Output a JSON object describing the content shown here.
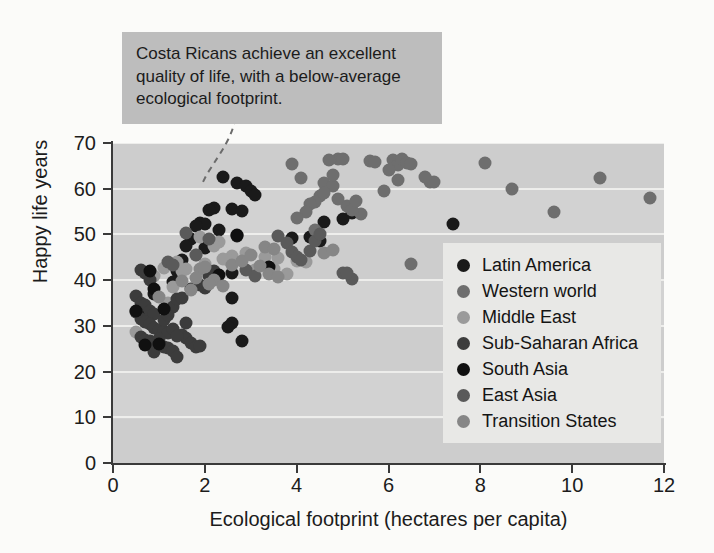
{
  "chart_data": {
    "type": "scatter",
    "title": "",
    "xlabel": "Ecological footprint (hectares per capita)",
    "ylabel": "Happy life years",
    "xlim": [
      0,
      12
    ],
    "ylim": [
      0,
      70
    ],
    "xticks": [
      0,
      2,
      4,
      6,
      8,
      10,
      12
    ],
    "yticks": [
      0,
      10,
      20,
      30,
      40,
      50,
      60,
      70
    ],
    "grid": "horizontal",
    "legend_position": "inside-bottom-right",
    "annotations": [
      {
        "text": "Costa Ricans achieve an excellent quality of life, with a below-average ecological footprint.",
        "points_to": [
          2.4,
          62.5
        ],
        "style": "gray-box-with-dashed-leader"
      }
    ],
    "series": [
      {
        "name": "Latin America",
        "color": "#1a1a1a",
        "points": [
          [
            2.4,
            62.5
          ],
          [
            2.7,
            61.2
          ],
          [
            2.9,
            60.6
          ],
          [
            3.0,
            59.6
          ],
          [
            3.1,
            58.6
          ],
          [
            2.2,
            55.8
          ],
          [
            2.1,
            55.3
          ],
          [
            2.6,
            55.6
          ],
          [
            2.8,
            55.2
          ],
          [
            1.9,
            52.6
          ],
          [
            2.0,
            52.3
          ],
          [
            1.8,
            51.8
          ],
          [
            2.3,
            50.9
          ],
          [
            2.7,
            49.7
          ],
          [
            1.7,
            49.0
          ],
          [
            1.6,
            47.4
          ],
          [
            2.0,
            47.0
          ],
          [
            4.6,
            52.8
          ],
          [
            5.0,
            53.4
          ],
          [
            5.2,
            54.7
          ],
          [
            7.4,
            52.2
          ],
          [
            4.3,
            49.5
          ],
          [
            1.5,
            44.3
          ],
          [
            1.4,
            42.0
          ],
          [
            2.6,
            41.5
          ],
          [
            3.9,
            49.3
          ],
          [
            4.5,
            48.5
          ],
          [
            1.3,
            39.5
          ],
          [
            0.9,
            37.0
          ],
          [
            0.7,
            33.5
          ],
          [
            0.6,
            32.8
          ],
          [
            2.6,
            36.0
          ],
          [
            2.6,
            30.7
          ],
          [
            2.5,
            29.8
          ],
          [
            2.8,
            26.6
          ]
        ]
      },
      {
        "name": "Western world",
        "color": "#6e6e6e",
        "points": [
          [
            5.6,
            66.0
          ],
          [
            5.7,
            65.9
          ],
          [
            4.9,
            66.6
          ],
          [
            5.0,
            66.4
          ],
          [
            4.7,
            66.2
          ],
          [
            6.1,
            66.2
          ],
          [
            6.2,
            65.1
          ],
          [
            6.3,
            66.5
          ],
          [
            6.4,
            65.6
          ],
          [
            6.5,
            65.5
          ],
          [
            8.1,
            65.7
          ],
          [
            6.0,
            64.0
          ],
          [
            6.2,
            62.0
          ],
          [
            6.9,
            61.5
          ],
          [
            7.0,
            61.4
          ],
          [
            6.8,
            62.5
          ],
          [
            5.9,
            59.5
          ],
          [
            8.7,
            60.0
          ],
          [
            10.6,
            62.4
          ],
          [
            11.7,
            57.9
          ],
          [
            9.6,
            55.0
          ],
          [
            5.4,
            54.5
          ],
          [
            4.6,
            61.2
          ],
          [
            4.8,
            60.5
          ],
          [
            4.5,
            58.4
          ],
          [
            4.4,
            57.2
          ],
          [
            4.3,
            56.6
          ],
          [
            5.1,
            56.3
          ],
          [
            5.2,
            55.3
          ],
          [
            4.2,
            54.8
          ],
          [
            4.8,
            63.0
          ],
          [
            4.1,
            62.3
          ],
          [
            3.9,
            65.4
          ],
          [
            6.5,
            43.5
          ],
          [
            4.9,
            57.8
          ],
          [
            4.6,
            59.0
          ],
          [
            5.3,
            57.4
          ],
          [
            4.0,
            53.6
          ],
          [
            4.4,
            51.0
          ]
        ]
      },
      {
        "name": "Middle East",
        "color": "#9a9a9a",
        "points": [
          [
            2.9,
            46.0
          ],
          [
            2.6,
            45.2
          ],
          [
            2.5,
            44.3
          ],
          [
            2.4,
            44.6
          ],
          [
            2.3,
            48.4
          ],
          [
            2.2,
            47.5
          ],
          [
            3.3,
            45.1
          ],
          [
            3.1,
            42.3
          ],
          [
            3.5,
            42.4
          ],
          [
            3.8,
            41.3
          ],
          [
            1.6,
            42.5
          ],
          [
            1.5,
            41.9
          ],
          [
            1.3,
            38.6
          ],
          [
            1.2,
            35.0
          ],
          [
            1.1,
            42.6
          ],
          [
            0.9,
            41.0
          ],
          [
            0.5,
            28.6
          ],
          [
            4.0,
            44.1
          ],
          [
            4.2,
            44.0
          ],
          [
            3.6,
            44.8
          ],
          [
            1.9,
            49.5
          ],
          [
            1.8,
            45.4
          ],
          [
            1.4,
            44.0
          ],
          [
            2.0,
            43.6
          ]
        ]
      },
      {
        "name": "Sub-Saharan Africa",
        "color": "#3c3c3c",
        "points": [
          [
            0.6,
            42.2
          ],
          [
            0.7,
            41.6
          ],
          [
            0.8,
            40.0
          ],
          [
            0.5,
            36.6
          ],
          [
            0.6,
            35.0
          ],
          [
            0.7,
            34.6
          ],
          [
            0.8,
            33.2
          ],
          [
            0.9,
            32.5
          ],
          [
            0.6,
            31.6
          ],
          [
            0.7,
            30.8
          ],
          [
            0.8,
            30.4
          ],
          [
            0.9,
            29.6
          ],
          [
            1.0,
            29.2
          ],
          [
            1.1,
            28.9
          ],
          [
            1.2,
            28.4
          ],
          [
            0.6,
            27.6
          ],
          [
            0.7,
            27.0
          ],
          [
            0.8,
            26.6
          ],
          [
            0.9,
            26.2
          ],
          [
            1.0,
            25.9
          ],
          [
            1.1,
            25.4
          ],
          [
            1.2,
            25.1
          ],
          [
            1.3,
            24.6
          ],
          [
            1.4,
            23.2
          ],
          [
            0.9,
            24.3
          ],
          [
            1.0,
            27.2
          ],
          [
            1.1,
            31.2
          ],
          [
            1.3,
            34.2
          ],
          [
            1.4,
            35.8
          ],
          [
            1.5,
            36.0
          ],
          [
            1.2,
            32.4
          ],
          [
            1.3,
            29.4
          ],
          [
            1.5,
            28.0
          ],
          [
            1.6,
            27.4
          ],
          [
            1.7,
            26.2
          ],
          [
            1.8,
            25.4
          ],
          [
            1.9,
            25.6
          ],
          [
            2.0,
            38.2
          ],
          [
            1.9,
            39.0
          ],
          [
            1.7,
            38.0
          ],
          [
            2.1,
            41.0
          ],
          [
            2.2,
            42.0
          ],
          [
            1.6,
            30.6
          ],
          [
            1.4,
            27.8
          ],
          [
            0.5,
            33.0
          ]
        ]
      },
      {
        "name": "South Asia",
        "color": "#101010",
        "points": [
          [
            0.5,
            33.2
          ],
          [
            0.8,
            42.0
          ],
          [
            0.7,
            25.8
          ],
          [
            1.0,
            26.0
          ],
          [
            2.7,
            49.8
          ],
          [
            2.3,
            41.2
          ],
          [
            1.1,
            33.6
          ],
          [
            0.9,
            38.0
          ],
          [
            3.4,
            42.9
          ]
        ]
      },
      {
        "name": "East Asia",
        "color": "#5a5a5a",
        "points": [
          [
            1.6,
            50.4
          ],
          [
            1.8,
            45.6
          ],
          [
            2.1,
            49.0
          ],
          [
            3.6,
            49.6
          ],
          [
            3.8,
            48.1
          ],
          [
            3.9,
            46.2
          ],
          [
            4.0,
            45.0
          ],
          [
            4.1,
            44.4
          ],
          [
            4.3,
            46.4
          ],
          [
            4.4,
            48.6
          ],
          [
            4.5,
            50.2
          ],
          [
            2.9,
            42.3
          ],
          [
            3.1,
            41.0
          ],
          [
            5.0,
            41.5
          ],
          [
            5.2,
            40.2
          ],
          [
            5.1,
            41.6
          ],
          [
            1.2,
            44.0
          ],
          [
            1.3,
            43.4
          ]
        ]
      },
      {
        "name": "Transition States",
        "color": "#868686",
        "points": [
          [
            1.9,
            42.4
          ],
          [
            2.0,
            42.8
          ],
          [
            2.2,
            40.0
          ],
          [
            2.4,
            38.8
          ],
          [
            2.6,
            43.4
          ],
          [
            2.8,
            44.2
          ],
          [
            3.0,
            45.6
          ],
          [
            3.2,
            43.0
          ],
          [
            3.4,
            41.4
          ],
          [
            3.6,
            40.6
          ],
          [
            2.1,
            39.2
          ],
          [
            1.8,
            40.4
          ],
          [
            1.5,
            39.8
          ],
          [
            1.7,
            37.8
          ],
          [
            3.3,
            47.2
          ],
          [
            3.5,
            46.8
          ],
          [
            4.6,
            46.0
          ],
          [
            4.8,
            46.6
          ],
          [
            1.0,
            36.4
          ]
        ]
      }
    ]
  },
  "callout": {
    "text": "Costa Ricans achieve an excellent quality of life, with a below-average ecological footprint."
  },
  "legend": {
    "items": [
      {
        "label": "Latin America"
      },
      {
        "label": "Western world"
      },
      {
        "label": "Middle East"
      },
      {
        "label": "Sub-Saharan Africa"
      },
      {
        "label": "South Asia"
      },
      {
        "label": "East Asia"
      },
      {
        "label": "Transition States"
      }
    ]
  }
}
